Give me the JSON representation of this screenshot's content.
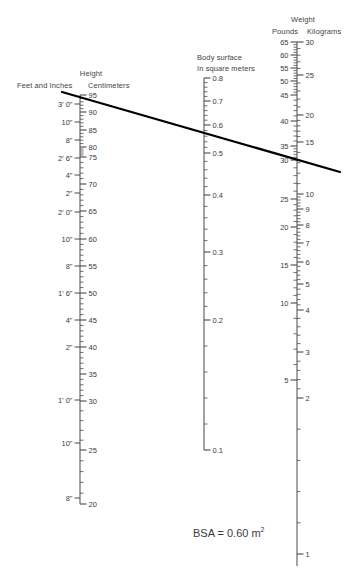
{
  "headers": {
    "height_group": "Height",
    "height_left": "Feet and Inches",
    "height_right": "Centimeters",
    "bsa_line1": "Body surface",
    "bsa_line2": "In square meters",
    "weight_group": "Weight",
    "weight_left": "Pounds",
    "weight_right": "Kilograms"
  },
  "result": {
    "prefix": "BSA = ",
    "value": "0.60",
    "unit": "m",
    "exponent": "2",
    "full_text": "BSA = 0.60 m2"
  },
  "chart_data": {
    "type": "nomogram",
    "axes": [
      {
        "name": "height_cm",
        "label": "Centimeters",
        "group": "Height",
        "side": "right-of-height-axis",
        "x": 80,
        "y_top": 95,
        "y_bottom": 504,
        "range": [
          95,
          20
        ],
        "major_step": 5,
        "minor_step": 1,
        "major_labels": [
          95,
          90,
          85,
          80,
          75,
          70,
          65,
          60,
          55,
          50,
          45,
          40,
          35,
          30,
          25,
          20
        ],
        "major_y": [
          95,
          112,
          130,
          147,
          157,
          184,
          211,
          239,
          266,
          293,
          320,
          347,
          374,
          401,
          450,
          504
        ]
      },
      {
        "name": "height_ft_in",
        "label": "Feet and Inches",
        "group": "Height",
        "side": "left-of-height-axis",
        "x": 62,
        "labels": [
          "3' 0\"",
          "10\"",
          "8\"",
          "2' 6\"",
          "4\"",
          "2\"",
          "2' 0\"",
          "10\"",
          "8\"",
          "1' 6\"",
          "4\"",
          "2\"",
          "1' 0\"",
          "10\"",
          "8\""
        ],
        "label_y": [
          104,
          122,
          140,
          158,
          175,
          193,
          212,
          239,
          266,
          293,
          320,
          347,
          400,
          443,
          498
        ]
      },
      {
        "name": "body_surface_m2",
        "label": "Body surface In square meters",
        "x": 204,
        "y_top": 78,
        "y_bottom": 450,
        "range": [
          0.8,
          0.1
        ],
        "major_step": 0.1,
        "major_labels": [
          "0.8",
          "0.7",
          "0.6",
          "0.5",
          "0.4",
          "0.3",
          "0.2",
          "0.1"
        ],
        "major_y": [
          78,
          101,
          125,
          153,
          195,
          252,
          320,
          450
        ]
      },
      {
        "name": "weight_pounds",
        "label": "Pounds",
        "group": "Weight",
        "side": "left-of-weight-axis",
        "x": 292,
        "range": [
          65,
          5
        ],
        "major_labels": [
          65,
          60,
          55,
          50,
          45,
          40,
          35,
          30,
          25,
          20,
          15,
          10,
          5
        ],
        "major_y": [
          42,
          55,
          68,
          81,
          95,
          121,
          146,
          160,
          199,
          227,
          265,
          303,
          380
        ]
      },
      {
        "name": "weight_kilograms",
        "label": "Kilograms",
        "group": "Weight",
        "side": "right-of-weight-axis",
        "x": 303,
        "range": [
          30,
          1
        ],
        "major_labels": [
          30,
          25,
          20,
          15,
          10,
          9,
          8,
          7,
          6,
          5,
          4,
          3,
          2,
          1
        ],
        "major_y": [
          42,
          75,
          115,
          142,
          194,
          209,
          225,
          243,
          262,
          284,
          310,
          352,
          398,
          554
        ]
      }
    ],
    "alignment_line": {
      "from": {
        "x": 62,
        "y": 92,
        "reads": "height ~ 95 cm"
      },
      "to": {
        "x": 340,
        "y": 172,
        "reads": "weight ~ 30 lb / 13.6 kg"
      },
      "crosses_bsa_at": {
        "x": 204,
        "y": 125,
        "value": "0.60"
      },
      "color": "#000000",
      "width": 2.2
    },
    "colors": {
      "axis": "#4a4a4a",
      "text": "#3a3a3a",
      "line": "#000000",
      "background": "#ffffff"
    }
  }
}
